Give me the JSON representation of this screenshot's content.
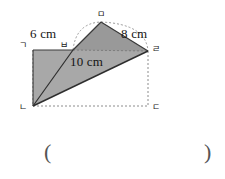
{
  "figure": {
    "kind": "geometry-diagram",
    "colors": {
      "fill_light": "#a8a8a8",
      "fill_dark": "#939393",
      "outline": "#3a3a3a",
      "dashed": "#8c8c8c",
      "background": "#ffffff",
      "text": "#141414"
    },
    "dimension_labels": [
      {
        "id": "label-6cm",
        "text": "6 cm"
      },
      {
        "id": "label-8cm",
        "text": "8 cm"
      },
      {
        "id": "label-10cm",
        "text": "10 cm"
      }
    ],
    "vertex_labels": [
      {
        "id": "vertex-g",
        "text": "ㄱ"
      },
      {
        "id": "vertex-b",
        "text": "ㅂ"
      },
      {
        "id": "vertex-m",
        "text": "ㅁ"
      },
      {
        "id": "vertex-r",
        "text": "ㄹ"
      },
      {
        "id": "vertex-n",
        "text": "ㄴ"
      },
      {
        "id": "vertex-d",
        "text": "ㄷ"
      }
    ]
  },
  "answer": {
    "open_paren": "(",
    "close_paren": ")"
  }
}
